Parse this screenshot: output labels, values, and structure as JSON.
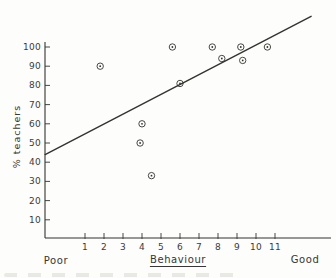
{
  "figure": {
    "ylabel": "% teachers",
    "xlabel": "Behaviour",
    "x_left_annotation": "Poor",
    "x_right_annotation": "Good",
    "background_color": "#fdfdfb",
    "ink_color": "#333330"
  },
  "chart_data": {
    "type": "scatter",
    "title": "",
    "xlabel": "Behaviour",
    "ylabel": "% teachers",
    "marker": "circled-dot",
    "grid": false,
    "legend": "none",
    "x_axis": {
      "ticks": [
        1,
        2,
        3,
        4,
        5,
        6,
        7,
        8,
        9,
        10,
        11
      ],
      "min_annotation": "Poor",
      "max_annotation": "Good",
      "xlim": [
        -1.1,
        14
      ]
    },
    "y_axis": {
      "ticks": [
        10,
        20,
        30,
        40,
        50,
        60,
        70,
        80,
        90,
        100
      ],
      "unit": "%",
      "ylim": [
        0,
        103
      ]
    },
    "points": [
      {
        "x": 1.8,
        "y": 90
      },
      {
        "x": 5.6,
        "y": 100
      },
      {
        "x": 7.7,
        "y": 100
      },
      {
        "x": 9.2,
        "y": 100
      },
      {
        "x": 10.6,
        "y": 100
      },
      {
        "x": 8.2,
        "y": 94
      },
      {
        "x": 9.3,
        "y": 93
      },
      {
        "x": 6.0,
        "y": 81
      },
      {
        "x": 4.0,
        "y": 60
      },
      {
        "x": 3.9,
        "y": 50
      },
      {
        "x": 4.5,
        "y": 33
      }
    ],
    "trend_line": {
      "x1": -1.1,
      "y1": 44,
      "x2": 12.9,
      "y2": 116
    }
  }
}
